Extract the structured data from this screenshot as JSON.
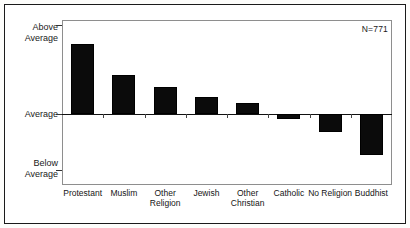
{
  "figure": {
    "annotation": "N=771",
    "y_axis": {
      "top_label_line1": "Above",
      "top_label_line2": "Average",
      "mid_label": "Average",
      "bottom_label_line1": "Below",
      "bottom_label_line2": "Average"
    }
  },
  "chart_data": {
    "type": "bar",
    "title": "",
    "subtitle": "",
    "xlabel": "",
    "ylabel": "",
    "orientation": "vertical",
    "grid": false,
    "legend": false,
    "baseline": "Average",
    "annotations": [
      {
        "text": "N=771",
        "position": "top-right"
      }
    ],
    "ytick_labels": [
      "Above Average",
      "Average",
      "Below Average"
    ],
    "ylim": [
      -100,
      100
    ],
    "categories": [
      "Protestant",
      "Muslim",
      "Other Religion",
      "Jewish",
      "Other Christian",
      "Catholic",
      "No Religion",
      "Buddhist"
    ],
    "category_lines": [
      [
        "Protestant"
      ],
      [
        "Muslim"
      ],
      [
        "Other",
        "Religion"
      ],
      [
        "Jewish"
      ],
      [
        "Other",
        "Christian"
      ],
      [
        "Catholic"
      ],
      [
        "No Religion"
      ],
      [
        "Buddhist"
      ]
    ],
    "values": [
      83,
      46,
      32,
      20,
      13,
      -7,
      -26,
      -58
    ],
    "bar_color": "#0b0b0b"
  }
}
